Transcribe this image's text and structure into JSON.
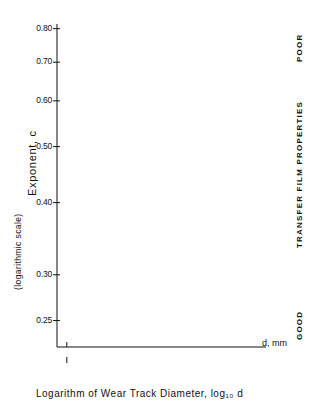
{
  "chart_data": {
    "type": "scatter",
    "title": "",
    "xlabel": "Logarithm of Wear Track Diameter, log₁₀ d",
    "ylabel": "Exponent, c",
    "ylabel_sub": "(logarithmic scale)",
    "y_scale": "logarithmic",
    "xlim": [
      1.805,
      2.125
    ],
    "ylim": [
      0.225,
      0.815
    ],
    "y_ticks": [
      "0.80",
      "0.70",
      "0.60",
      "0.50",
      "0.40",
      "0.30",
      "0.25"
    ],
    "y_tick_values": [
      0.8,
      0.7,
      0.6,
      0.5,
      0.4,
      0.3,
      0.25
    ],
    "x_ticks_log": [
      "1.82",
      "1.86",
      "1.90",
      "1.94",
      "1.98",
      "2.02",
      "2.06",
      "2.10"
    ],
    "x_tick_values": [
      1.82,
      1.86,
      1.9,
      1.94,
      1.98,
      2.02,
      2.06,
      2.1
    ],
    "x_secondary_label": "d, mm",
    "x_secondary_ticks": [
      "69",
      "84",
      "99",
      "114",
      "129"
    ],
    "x_secondary_values": [
      1.839,
      1.924,
      1.996,
      2.057,
      2.111
    ],
    "right_axis": {
      "label": "TRANSFER FILM PROPERTIES",
      "top_label": "POOR",
      "bottom_label": "GOOD"
    },
    "grid": false,
    "legend_position": "right-inline",
    "series": [
      {
        "name": "100A",
        "marker": "open-circle",
        "line": "solid-with-dashed-extension",
        "points": [
          {
            "x": 1.839,
            "y": 0.742
          },
          {
            "x": 1.924,
            "y": 0.77
          },
          {
            "x": 1.996,
            "y": 0.77
          }
        ],
        "dashed_extension": {
          "x_from": 2.02,
          "x_to": 2.12,
          "y": 0.784
        }
      },
      {
        "name": "100B",
        "marker": "open-circle",
        "line": "solid",
        "points": [
          {
            "x": 1.839,
            "y": 0.684
          },
          {
            "x": 1.924,
            "y": 0.7
          },
          {
            "x": 1.996,
            "y": 0.733
          },
          {
            "x": 2.057,
            "y": 0.755
          },
          {
            "x": 2.111,
            "y": 0.765
          }
        ]
      },
      {
        "name": "102B",
        "marker": "half-filled-circle",
        "line": "solid",
        "points": [
          {
            "x": 1.924,
            "y": 0.685
          },
          {
            "x": 1.996,
            "y": 0.704
          },
          {
            "x": 2.057,
            "y": 0.719
          },
          {
            "x": 2.111,
            "y": 0.74
          }
        ]
      },
      {
        "name": "201",
        "marker": "open-triangle",
        "line": "solid",
        "points": [
          {
            "x": 1.839,
            "y": 0.534
          },
          {
            "x": 2.057,
            "y": 0.652
          },
          {
            "x": 2.111,
            "y": 0.69
          }
        ]
      },
      {
        "name": "101",
        "marker": "open-circle",
        "line": "solid",
        "points": [
          {
            "x": 1.924,
            "y": 0.545
          },
          {
            "x": 1.996,
            "y": 0.54
          },
          {
            "x": 2.057,
            "y": 0.563
          },
          {
            "x": 2.111,
            "y": 0.562
          }
        ]
      },
      {
        "name": "102A",
        "marker": "filled-circle",
        "line": "solid",
        "points": [
          {
            "x": 1.839,
            "y": 0.47
          },
          {
            "x": 2.057,
            "y": 0.55
          },
          {
            "x": 2.111,
            "y": 0.558
          }
        ]
      },
      {
        "name": "103",
        "marker": "open-circle",
        "line": "solid",
        "points": [
          {
            "x": 1.996,
            "y": 0.385
          },
          {
            "x": 2.057,
            "y": 0.378
          },
          {
            "x": 2.111,
            "y": 0.368
          }
        ]
      },
      {
        "name": "202",
        "marker": "open-circle",
        "line": "solid",
        "points": [
          {
            "x": 1.839,
            "y": 0.372
          },
          {
            "x": 1.996,
            "y": 0.289
          },
          {
            "x": 2.057,
            "y": 0.262
          },
          {
            "x": 2.111,
            "y": 0.243
          }
        ]
      }
    ]
  }
}
